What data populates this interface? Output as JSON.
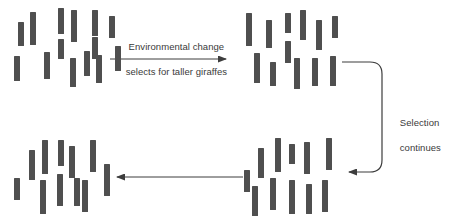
{
  "figure": {
    "background_color": "#ffffff",
    "bar_color": "#4f4f4f",
    "line_color": "#3d3d3d",
    "text_color": "#3a3a3a",
    "width": 449,
    "height": 224
  },
  "labels": {
    "top_arrow_line1": "Environmental change",
    "top_arrow_line2": "selects for taller giraffes",
    "right_arrow_line1": "Selection",
    "right_arrow_line2": "continues"
  },
  "clusters": [
    {
      "id": "population-initial",
      "name": "Initial giraffe population (mixed heights)",
      "origin": {
        "x": 14,
        "y": 8
      },
      "count": 14,
      "bars": [
        {
          "x": 4,
          "y": 14,
          "w": 6,
          "h": 24
        },
        {
          "x": 16,
          "y": 4,
          "w": 6,
          "h": 33
        },
        {
          "x": 30,
          "y": 44,
          "w": 6,
          "h": 27
        },
        {
          "x": 0,
          "y": 48,
          "w": 6,
          "h": 25
        },
        {
          "x": 44,
          "y": 0,
          "w": 6,
          "h": 26
        },
        {
          "x": 57,
          "y": 2,
          "w": 6,
          "h": 32
        },
        {
          "x": 44,
          "y": 31,
          "w": 6,
          "h": 20
        },
        {
          "x": 56,
          "y": 50,
          "w": 6,
          "h": 29
        },
        {
          "x": 70,
          "y": 43,
          "w": 6,
          "h": 25
        },
        {
          "x": 82,
          "y": 47,
          "w": 6,
          "h": 28
        },
        {
          "x": 78,
          "y": 2,
          "w": 6,
          "h": 26
        },
        {
          "x": 95,
          "y": 8,
          "w": 6,
          "h": 22
        },
        {
          "x": 78,
          "y": 29,
          "w": 6,
          "h": 22
        },
        {
          "x": 101,
          "y": 38,
          "w": 6,
          "h": 25
        }
      ]
    },
    {
      "id": "population-after-selection-1",
      "name": "Population after first round of selection",
      "origin": {
        "x": 244,
        "y": 8
      },
      "count": 12,
      "bars": [
        {
          "x": 2,
          "y": 5,
          "w": 6,
          "h": 33
        },
        {
          "x": 22,
          "y": 12,
          "w": 6,
          "h": 28
        },
        {
          "x": 41,
          "y": 5,
          "w": 6,
          "h": 20
        },
        {
          "x": 41,
          "y": 33,
          "w": 6,
          "h": 22
        },
        {
          "x": 10,
          "y": 45,
          "w": 6,
          "h": 30
        },
        {
          "x": 26,
          "y": 54,
          "w": 6,
          "h": 24
        },
        {
          "x": 50,
          "y": 50,
          "w": 6,
          "h": 31
        },
        {
          "x": 56,
          "y": 2,
          "w": 6,
          "h": 30
        },
        {
          "x": 72,
          "y": 12,
          "w": 6,
          "h": 30
        },
        {
          "x": 68,
          "y": 50,
          "w": 6,
          "h": 28
        },
        {
          "x": 86,
          "y": 48,
          "w": 6,
          "h": 30
        },
        {
          "x": 88,
          "y": 8,
          "w": 6,
          "h": 22
        }
      ]
    },
    {
      "id": "population-after-selection-2",
      "name": "Population after continued selection",
      "origin": {
        "x": 244,
        "y": 138
      },
      "count": 11,
      "bars": [
        {
          "x": 0,
          "y": 32,
          "w": 6,
          "h": 22
        },
        {
          "x": 14,
          "y": 10,
          "w": 6,
          "h": 30
        },
        {
          "x": 31,
          "y": 0,
          "w": 6,
          "h": 34
        },
        {
          "x": 45,
          "y": 6,
          "w": 6,
          "h": 20
        },
        {
          "x": 26,
          "y": 40,
          "w": 6,
          "h": 32
        },
        {
          "x": 8,
          "y": 48,
          "w": 6,
          "h": 30
        },
        {
          "x": 45,
          "y": 42,
          "w": 6,
          "h": 34
        },
        {
          "x": 60,
          "y": 4,
          "w": 6,
          "h": 32
        },
        {
          "x": 62,
          "y": 46,
          "w": 6,
          "h": 30
        },
        {
          "x": 78,
          "y": 42,
          "w": 6,
          "h": 32
        },
        {
          "x": 82,
          "y": 0,
          "w": 6,
          "h": 32
        }
      ]
    },
    {
      "id": "population-final",
      "name": "Final taller giraffe population",
      "origin": {
        "x": 14,
        "y": 138
      },
      "count": 11,
      "bars": [
        {
          "x": 0,
          "y": 40,
          "w": 6,
          "h": 22
        },
        {
          "x": 15,
          "y": 12,
          "w": 6,
          "h": 30
        },
        {
          "x": 28,
          "y": 2,
          "w": 6,
          "h": 34
        },
        {
          "x": 26,
          "y": 42,
          "w": 6,
          "h": 34
        },
        {
          "x": 43,
          "y": 36,
          "w": 6,
          "h": 32
        },
        {
          "x": 55,
          "y": 8,
          "w": 6,
          "h": 32
        },
        {
          "x": 68,
          "y": 42,
          "w": 6,
          "h": 32
        },
        {
          "x": 76,
          "y": 2,
          "w": 6,
          "h": 32
        },
        {
          "x": 90,
          "y": 26,
          "w": 6,
          "h": 32
        },
        {
          "x": 44,
          "y": 2,
          "w": 6,
          "h": 26
        },
        {
          "x": 60,
          "y": 40,
          "w": 6,
          "h": 28
        }
      ]
    }
  ],
  "connectors": [
    {
      "id": "arrow-top",
      "name": "Top arrow pointing right",
      "direction": "right",
      "path": "M110,59 L226,59"
    },
    {
      "id": "arrow-right-loop",
      "name": "Right rounded connector, selection continues",
      "direction": "left",
      "path": "M342,62 L370,62 Q382,62 382,74 L382,160 Q382,172 370,172 L349,172"
    },
    {
      "id": "arrow-bottom",
      "name": "Bottom arrow pointing left",
      "direction": "left",
      "path": "M243,177 L117,177"
    }
  ]
}
